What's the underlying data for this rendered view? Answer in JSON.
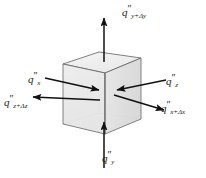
{
  "figure": {
    "background_color": "#ffffff",
    "cube": {
      "name": "control-volume-cube",
      "face_fill": "#e9e9e9",
      "face_fill_top": "#f2f2f2",
      "face_fill_right": "#dddddd",
      "edge_color": "#5a5a5a",
      "hidden_edge_color": "#a8a8a8"
    },
    "arrow_color": "#111111",
    "labels": {
      "top": {
        "name": "flux-label-y-plus-dy",
        "symbol": "q",
        "primes": "″",
        "subscript": "y+Δy",
        "full": "q″y+Δy",
        "direction": "up",
        "sense": "outflow"
      },
      "left_upper": {
        "name": "flux-label-x",
        "symbol": "q",
        "primes": "″",
        "subscript": "x",
        "full": "q″x",
        "direction": "right",
        "sense": "inflow"
      },
      "left_lower": {
        "name": "flux-label-z-plus-dz",
        "symbol": "q",
        "primes": "″",
        "subscript": "z+Δz",
        "full": "q″z+Δz",
        "direction": "left",
        "sense": "outflow"
      },
      "right_upper": {
        "name": "flux-label-z",
        "symbol": "q",
        "primes": "″",
        "subscript": "z",
        "full": "q″z",
        "direction": "left",
        "sense": "inflow"
      },
      "right_lower": {
        "name": "flux-label-x-plus-dx",
        "symbol": "q",
        "primes": "″",
        "subscript": "x+Δx",
        "full": "q″x+Δx",
        "direction": "right",
        "sense": "outflow"
      },
      "bottom": {
        "name": "flux-label-y",
        "symbol": "q",
        "primes": "″",
        "subscript": "y",
        "full": "q″y",
        "direction": "up",
        "sense": "inflow"
      }
    }
  }
}
